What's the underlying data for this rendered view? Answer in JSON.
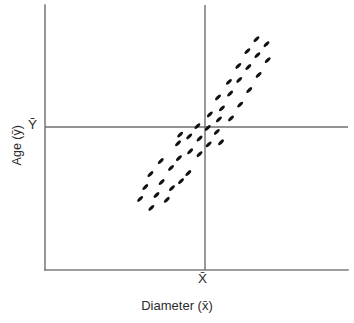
{
  "figure": {
    "background": "#ffffff",
    "axis_color": "#7d7d7d",
    "mean_line_color": "#6e6e6e",
    "marker_color": "#111111",
    "text_color": "#2b2b2b"
  },
  "labels": {
    "y_axis": "Age (ȳ)",
    "x_axis": "Diameter (x̄)",
    "y_mean_tick": "Ȳ",
    "x_mean_tick": "X̄"
  },
  "chart_data": {
    "type": "scatter",
    "title": "",
    "xlabel": "Diameter (x̄)",
    "ylabel": "Age (ȳ)",
    "grid": false,
    "legend": null,
    "xlim": [
      0,
      100
    ],
    "ylim": [
      0,
      100
    ],
    "annotations": [
      {
        "name": "x-mean-line",
        "orientation": "vertical",
        "value": 52.8,
        "label": "X̄"
      },
      {
        "name": "y-mean-line",
        "orientation": "horizontal",
        "value": 53.9,
        "label": "Ȳ"
      }
    ],
    "marker_style": {
      "shape": "ellipse",
      "rotation_deg": -45,
      "length": 7.4,
      "width": 3.2,
      "color": "#111111"
    },
    "points": [
      [
        31.4,
        26.8
      ],
      [
        33.1,
        31.3
      ],
      [
        35.1,
        23.4
      ],
      [
        36.8,
        28.3
      ],
      [
        34.8,
        36.2
      ],
      [
        38.5,
        33.2
      ],
      [
        40.2,
        26.5
      ],
      [
        41.9,
        30.9
      ],
      [
        38.2,
        41.1
      ],
      [
        41.6,
        38.5
      ],
      [
        44.9,
        33.5
      ],
      [
        44.2,
        42.2
      ],
      [
        47.3,
        36.6
      ],
      [
        47.9,
        44.8
      ],
      [
        43.9,
        47.8
      ],
      [
        47.6,
        50.4
      ],
      [
        51.0,
        43.7
      ],
      [
        51.0,
        49.6
      ],
      [
        54.0,
        47.4
      ],
      [
        50.3,
        54.3
      ],
      [
        53.7,
        53.6
      ],
      [
        56.7,
        52.1
      ],
      [
        57.4,
        56.8
      ],
      [
        54.4,
        58.7
      ],
      [
        58.4,
        61.0
      ],
      [
        61.4,
        57.2
      ],
      [
        57.1,
        65.1
      ],
      [
        61.1,
        66.6
      ],
      [
        64.4,
        62.4
      ],
      [
        60.7,
        71.0
      ],
      [
        64.1,
        71.7
      ],
      [
        67.4,
        67.9
      ],
      [
        63.8,
        77.0
      ],
      [
        67.1,
        76.6
      ],
      [
        70.5,
        73.6
      ],
      [
        66.8,
        82.6
      ],
      [
        70.1,
        81.1
      ],
      [
        73.5,
        79.2
      ],
      [
        69.8,
        87.1
      ],
      [
        73.1,
        85.2
      ],
      [
        58.1,
        48.2
      ],
      [
        44.6,
        51.1
      ]
    ]
  }
}
